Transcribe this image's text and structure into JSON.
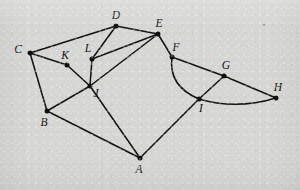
{
  "figure": {
    "background_color": "#d6d6d4",
    "ink_color": "#141414",
    "width": 300,
    "height": 190
  },
  "graph": {
    "type": "undirected-graph",
    "vertex_count": 12,
    "edge_count": 19,
    "vertices": [
      {
        "id": "A",
        "label": "A",
        "x": 140,
        "y": 158,
        "label_dx": -1,
        "label_dy": 15
      },
      {
        "id": "B",
        "label": "B",
        "x": 47,
        "y": 111,
        "label_dx": -3,
        "label_dy": 15
      },
      {
        "id": "C",
        "label": "C",
        "x": 30,
        "y": 53,
        "label_dx": -12,
        "label_dy": 0
      },
      {
        "id": "D",
        "label": "D",
        "x": 116,
        "y": 26,
        "label_dx": 0,
        "label_dy": -7
      },
      {
        "id": "E",
        "label": "E",
        "x": 158,
        "y": 34,
        "label_dx": 1,
        "label_dy": -7
      },
      {
        "id": "F",
        "label": "F",
        "x": 172,
        "y": 57,
        "label_dx": 4,
        "label_dy": -6
      },
      {
        "id": "G",
        "label": "G",
        "x": 224,
        "y": 76,
        "label_dx": 2,
        "label_dy": -7
      },
      {
        "id": "H",
        "label": "H",
        "x": 276,
        "y": 98,
        "label_dx": 2,
        "label_dy": -7
      },
      {
        "id": "I",
        "label": "I",
        "x": 199,
        "y": 99,
        "label_dx": 2,
        "label_dy": 13
      },
      {
        "id": "J",
        "label": "J",
        "x": 90,
        "y": 86,
        "label_dx": 6,
        "label_dy": 11
      },
      {
        "id": "K",
        "label": "K",
        "x": 67,
        "y": 65,
        "label_dx": -2,
        "label_dy": -6
      },
      {
        "id": "L",
        "label": "L",
        "x": 92,
        "y": 59,
        "label_dx": -4,
        "label_dy": -7
      }
    ],
    "edges": [
      {
        "from": "C",
        "to": "D",
        "shape": "line"
      },
      {
        "from": "C",
        "to": "K",
        "shape": "line"
      },
      {
        "from": "C",
        "to": "B",
        "shape": "line"
      },
      {
        "from": "K",
        "to": "J",
        "shape": "line"
      },
      {
        "from": "D",
        "to": "L",
        "shape": "line"
      },
      {
        "from": "D",
        "to": "E",
        "shape": "line"
      },
      {
        "from": "L",
        "to": "E",
        "shape": "line"
      },
      {
        "from": "L",
        "to": "J",
        "shape": "line"
      },
      {
        "from": "E",
        "to": "F",
        "shape": "line"
      },
      {
        "from": "E",
        "to": "J",
        "shape": "line"
      },
      {
        "from": "F",
        "to": "G",
        "shape": "line"
      },
      {
        "from": "G",
        "to": "H",
        "shape": "line"
      },
      {
        "from": "G",
        "to": "I",
        "shape": "line"
      },
      {
        "from": "B",
        "to": "J",
        "shape": "line"
      },
      {
        "from": "B",
        "to": "A",
        "shape": "line"
      },
      {
        "from": "J",
        "to": "A",
        "shape": "line"
      },
      {
        "from": "A",
        "to": "I",
        "shape": "line"
      },
      {
        "from": "F",
        "to": "I",
        "shape": "curve",
        "control_x": 168,
        "control_y": 86
      },
      {
        "from": "I",
        "to": "H",
        "shape": "curve",
        "control_x": 236,
        "control_y": 110
      }
    ]
  },
  "bleed_through_text": {
    "line1": "",
    "line2": "",
    "line3": ""
  }
}
